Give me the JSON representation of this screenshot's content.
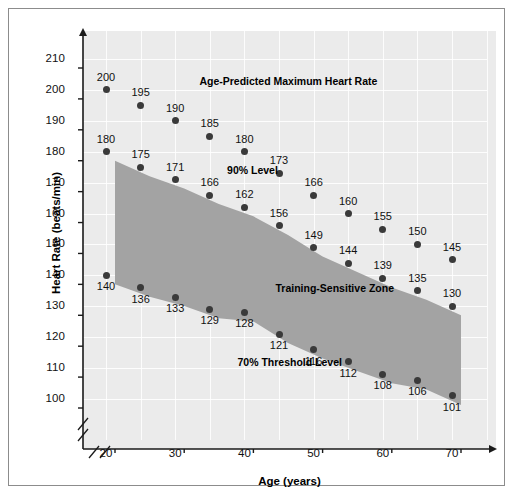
{
  "chart_data": {
    "type": "scatter",
    "title": "",
    "xlabel": "Age (years)",
    "ylabel": "Heart Rate (beats/min)",
    "xlim": [
      17,
      75
    ],
    "ylim": [
      95,
      215
    ],
    "xticks": [
      20,
      30,
      40,
      50,
      60,
      70
    ],
    "yticks": [
      100,
      110,
      120,
      130,
      140,
      150,
      160,
      170,
      180,
      190,
      200,
      210
    ],
    "grid": true,
    "legend_position": "inline-annotations",
    "axis_break": true,
    "x": [
      20,
      25,
      30,
      35,
      40,
      45,
      50,
      55,
      60,
      65,
      70
    ],
    "series": [
      {
        "name": "Age-Predicted Maximum Heart Rate",
        "values": [
          200,
          195,
          190,
          185,
          180,
          173,
          166,
          160,
          155,
          150,
          145
        ]
      },
      {
        "name": "90% Level",
        "values": [
          180,
          175,
          171,
          166,
          162,
          156,
          149,
          144,
          139,
          135,
          130
        ]
      },
      {
        "name": "70% Threshold Level",
        "values": [
          140,
          136,
          133,
          129,
          128,
          121,
          116,
          112,
          108,
          106,
          101
        ]
      }
    ],
    "annotations": [
      {
        "text": "Age-Predicted Maximum Heart Rate",
        "x": 33.5,
        "y": 203
      },
      {
        "text": "90% Level",
        "x": 37.5,
        "y": 174
      },
      {
        "text": "Training-Sensitive Zone",
        "x": 44.5,
        "y": 136
      },
      {
        "text": "70% Threshold Level",
        "x": 39.0,
        "y": 112
      }
    ],
    "shaded_band": {
      "label": "Training-Sensitive Zone",
      "upper_series": "90% Level",
      "lower_series": "70% Threshold Level",
      "fill_color": "#a3a3a3"
    },
    "colors": {
      "plot_background": "#ebebeb",
      "grid": "#ffffff",
      "marker": "#3a3a3a",
      "axis": "#1a1a1a",
      "band_fill": "#a3a3a3"
    }
  }
}
